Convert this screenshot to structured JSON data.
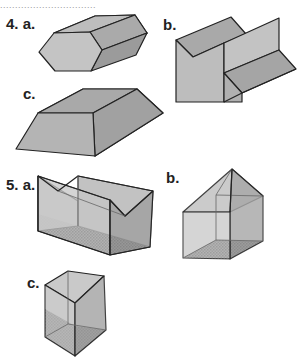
{
  "header": {
    "cut_text": "................................"
  },
  "problems": [
    {
      "number": "4.",
      "parts": [
        {
          "letter": "a.",
          "description": "hexagonal prism"
        },
        {
          "letter": "b.",
          "description": "folded sheet / step shape"
        },
        {
          "letter": "c.",
          "description": "trapezoidal prism"
        }
      ]
    },
    {
      "number": "5.",
      "parts": [
        {
          "letter": "a.",
          "description": "transparent box with V-notch top and shaded base"
        },
        {
          "letter": "b.",
          "description": "transparent house-shaped prism with pyramid top and shaded base"
        },
        {
          "letter": "c.",
          "description": "transparent triangular prism with shaded base"
        }
      ]
    }
  ],
  "colors": {
    "face_light": "#c8c8c8",
    "face_mid": "#a9a9a9",
    "face_dark": "#8f8f8f",
    "edge": "#222222",
    "glass": "#d4d4d4"
  }
}
